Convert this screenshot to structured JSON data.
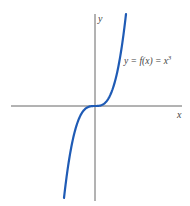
{
  "chart_data": {
    "type": "line",
    "title": "",
    "xlabel": "x",
    "ylabel": "y",
    "annotation": "y = f(x) = x³",
    "series": [
      {
        "name": "y = f(x) = x^3",
        "color": "#1f5bb5",
        "x": [
          -1.5,
          -1.25,
          -1.0,
          -0.75,
          -0.5,
          -0.25,
          0,
          0.25,
          0.5,
          0.75,
          1.0,
          1.25,
          1.5
        ],
        "y": [
          -3.375,
          -1.953,
          -1.0,
          -0.422,
          -0.125,
          -0.016,
          0,
          0.016,
          0.125,
          0.422,
          1.0,
          1.953,
          3.375
        ]
      }
    ],
    "grid": false,
    "ticks": "none"
  },
  "labels": {
    "x_axis": "x",
    "y_axis": "y",
    "curve_prefix": "y = f(x) = x",
    "curve_exp": "3"
  }
}
